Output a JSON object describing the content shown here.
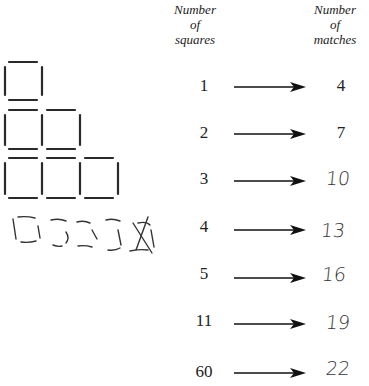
{
  "headers": {
    "squares": [
      "Number",
      "of",
      "squares"
    ],
    "matches": [
      "Number",
      "of",
      "matches"
    ]
  },
  "rows": [
    {
      "squares": "1",
      "matches": "4",
      "handwritten": false
    },
    {
      "squares": "2",
      "matches": "7",
      "handwritten": false
    },
    {
      "squares": "3",
      "matches": "10",
      "handwritten": true
    },
    {
      "squares": "4",
      "matches": "13",
      "handwritten": true
    },
    {
      "squares": "5",
      "matches": "16",
      "handwritten": true
    },
    {
      "squares": "11",
      "matches": "19",
      "handwritten": true
    },
    {
      "squares": "60",
      "matches": "22",
      "handwritten": true
    }
  ],
  "figure": {
    "rows_of_squares": [
      1,
      2,
      3
    ],
    "handwritten_row": "4 squares drawn with a crossed-out extra",
    "stroke_color": "#2a2a2a"
  }
}
